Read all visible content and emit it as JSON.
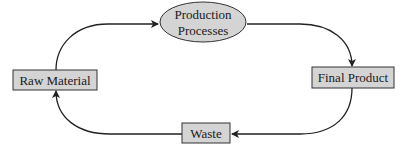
{
  "diagram": {
    "type": "cycle",
    "nodes": [
      {
        "id": "production",
        "label_lines": [
          "Production",
          "Processes"
        ],
        "shape": "ellipse"
      },
      {
        "id": "final",
        "label": "Final Product",
        "shape": "rectangle"
      },
      {
        "id": "waste",
        "label": "Waste",
        "shape": "rectangle"
      },
      {
        "id": "raw",
        "label": "Raw Material",
        "shape": "rectangle"
      }
    ],
    "edges": [
      {
        "from": "raw",
        "to": "production"
      },
      {
        "from": "production",
        "to": "final"
      },
      {
        "from": "final",
        "to": "waste"
      },
      {
        "from": "waste",
        "to": "raw"
      }
    ],
    "colors": {
      "node_fill": "#d4d4d4",
      "stroke": "#333333"
    }
  }
}
